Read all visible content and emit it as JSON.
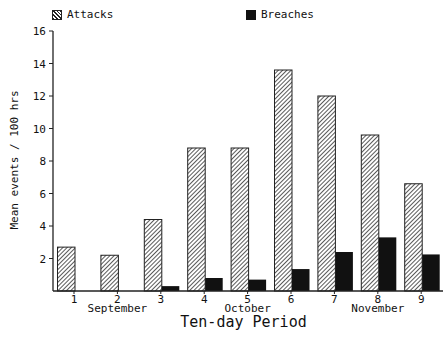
{
  "legend": {
    "attacks_label": "Attacks",
    "breaches_label": "Breaches"
  },
  "axes": {
    "ylabel": "Mean events / 100 hrs",
    "xlabel": "Ten-day Period",
    "months": [
      {
        "label": "September",
        "at": 2
      },
      {
        "label": "October",
        "at": 5
      },
      {
        "label": "November",
        "at": 8
      }
    ]
  },
  "colors": {
    "breaches": "#111111",
    "attacks_hatch": "#222222",
    "axis": "#222222"
  },
  "chart_data": {
    "type": "bar",
    "title": "",
    "xlabel": "Ten-day Period",
    "ylabel": "Mean events / 100 hrs",
    "categories": [
      "1",
      "2",
      "3",
      "4",
      "5",
      "6",
      "7",
      "8",
      "9"
    ],
    "category_groups": {
      "September": [
        "1",
        "2",
        "3"
      ],
      "October": [
        "4",
        "5",
        "6"
      ],
      "November": [
        "7",
        "8",
        "9"
      ]
    },
    "series": [
      {
        "name": "Attacks",
        "style": "hatched",
        "values": [
          2.7,
          2.2,
          4.4,
          8.8,
          8.8,
          13.6,
          12.0,
          9.6,
          6.6
        ]
      },
      {
        "name": "Breaches",
        "style": "solid black",
        "values": [
          0,
          0,
          0.3,
          0.8,
          0.7,
          1.35,
          2.4,
          3.3,
          2.25
        ]
      }
    ],
    "ylim": [
      0,
      16
    ],
    "yticks": [
      2,
      4,
      6,
      8,
      10,
      12,
      14,
      16
    ],
    "grid": false,
    "legend_position": "top"
  }
}
